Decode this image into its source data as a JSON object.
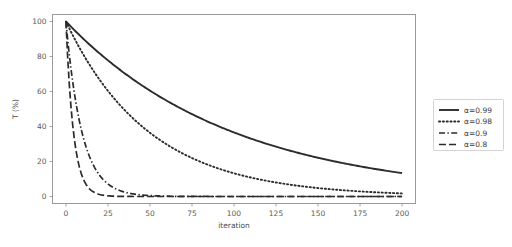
{
  "chart_data": {
    "type": "line",
    "title": "",
    "xlabel": "iteration",
    "ylabel": "T (%)",
    "xlim": [
      -8,
      208
    ],
    "ylim": [
      -4,
      104
    ],
    "xticks": [
      0,
      25,
      50,
      75,
      100,
      125,
      150,
      175,
      200
    ],
    "yticks": [
      0,
      20,
      40,
      60,
      80,
      100
    ],
    "grid": false,
    "legend_position": "right-outside",
    "line_color": "#2b2b2b",
    "axis_color": "#9a9a9a",
    "x": [
      0,
      5,
      10,
      15,
      20,
      25,
      30,
      35,
      40,
      45,
      50,
      55,
      60,
      65,
      70,
      75,
      80,
      85,
      90,
      95,
      100,
      105,
      110,
      115,
      120,
      125,
      130,
      135,
      140,
      145,
      150,
      155,
      160,
      165,
      170,
      175,
      180,
      185,
      190,
      195,
      200
    ],
    "series": [
      {
        "name": "α=0.99",
        "alpha": 0.99,
        "style": "solid",
        "dash": "none",
        "width": 1.9,
        "values": [
          100.0,
          95.1,
          90.4,
          86.0,
          81.8,
          77.8,
          74.0,
          70.3,
          66.9,
          63.6,
          60.5,
          57.5,
          54.7,
          52.0,
          49.5,
          47.0,
          44.7,
          42.5,
          40.5,
          38.5,
          36.6,
          34.8,
          33.1,
          31.5,
          29.9,
          28.5,
          27.1,
          25.7,
          24.5,
          23.3,
          22.1,
          21.0,
          20.0,
          19.0,
          18.1,
          17.2,
          16.4,
          15.6,
          14.8,
          14.1,
          13.4
        ]
      },
      {
        "name": "α=0.98",
        "alpha": 0.98,
        "style": "dotted",
        "dash": "1.2,2.6",
        "width": 1.9,
        "values": [
          100.0,
          90.4,
          81.7,
          73.9,
          66.8,
          60.3,
          54.5,
          49.3,
          44.6,
          40.3,
          36.4,
          32.9,
          29.8,
          26.9,
          24.3,
          22.0,
          19.9,
          18.0,
          16.2,
          14.7,
          13.3,
          12.0,
          10.8,
          9.8,
          8.9,
          8.0,
          7.2,
          6.5,
          5.9,
          5.3,
          4.8,
          4.4,
          3.9,
          3.6,
          3.2,
          2.9,
          2.6,
          2.4,
          2.1,
          1.9,
          1.8
        ]
      },
      {
        "name": "α=0.9",
        "alpha": 0.9,
        "style": "dashdot",
        "dash": "6,2.4,1.4,2.4",
        "width": 1.7,
        "values": [
          100.0,
          59.0,
          34.9,
          20.6,
          12.2,
          7.2,
          4.2,
          2.5,
          1.5,
          0.9,
          0.5,
          0.3,
          0.2,
          0.1,
          0.1,
          0.0,
          0.0,
          0.0,
          0.0,
          0.0,
          0.0,
          0.0,
          0.0,
          0.0,
          0.0,
          0.0,
          0.0,
          0.0,
          0.0,
          0.0,
          0.0,
          0.0,
          0.0,
          0.0,
          0.0,
          0.0,
          0.0,
          0.0,
          0.0,
          0.0,
          0.0
        ]
      },
      {
        "name": "α=0.8",
        "alpha": 0.8,
        "style": "dashed",
        "dash": "7,3",
        "width": 1.7,
        "values": [
          100.0,
          32.8,
          10.7,
          3.5,
          1.2,
          0.4,
          0.1,
          0.0,
          0.0,
          0.0,
          0.0,
          0.0,
          0.0,
          0.0,
          0.0,
          0.0,
          0.0,
          0.0,
          0.0,
          0.0,
          0.0,
          0.0,
          0.0,
          0.0,
          0.0,
          0.0,
          0.0,
          0.0,
          0.0,
          0.0,
          0.0,
          0.0,
          0.0,
          0.0,
          0.0,
          0.0,
          0.0,
          0.0,
          0.0,
          0.0,
          0.0
        ]
      }
    ],
    "legend_entries": [
      {
        "label": "α=0.99",
        "style": "solid"
      },
      {
        "label": "α=0.98",
        "style": "dotted"
      },
      {
        "label": "α=0.9",
        "style": "dashdot"
      },
      {
        "label": "α=0.8",
        "style": "dashed"
      }
    ]
  }
}
